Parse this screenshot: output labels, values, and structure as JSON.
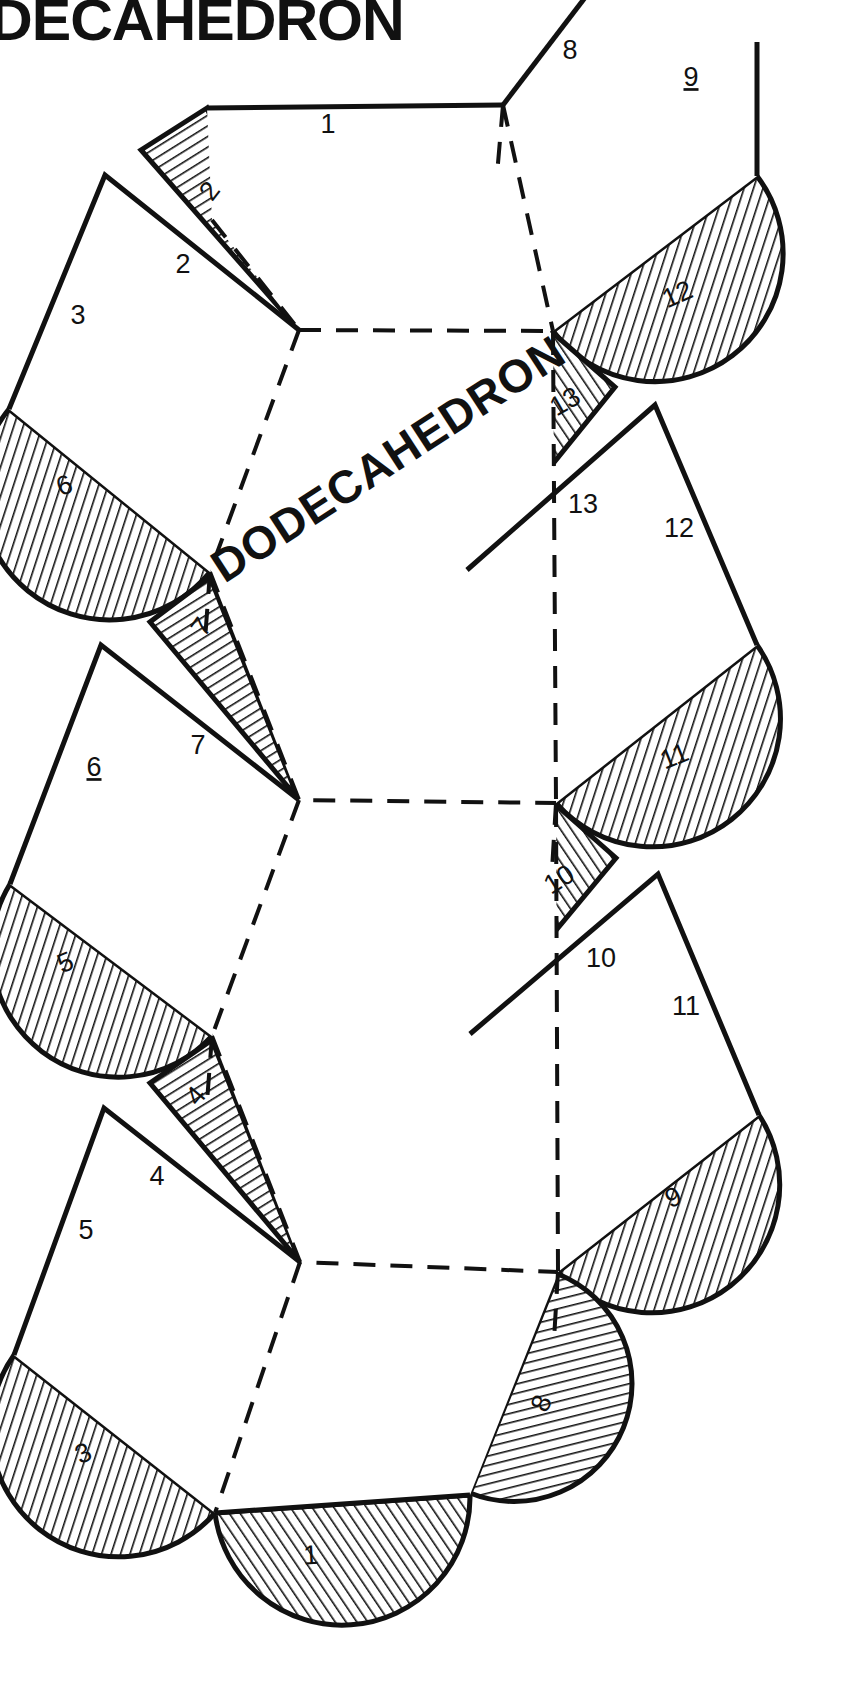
{
  "document": {
    "title": "DECAHEDRON",
    "center_caption": "DODECAHEDRON",
    "ink_color": "#111111",
    "paper_color": "#ffffff"
  },
  "net": {
    "type": "dodecahedron-net",
    "face_count": 6,
    "edge_style_solid": "cut",
    "edge_style_dashed": "fold",
    "tab_hatch": "diagonal-line-hatch"
  },
  "edge_labels": [
    {
      "id": "e1",
      "text": "1",
      "x": 328,
      "y": 126,
      "underline": false
    },
    {
      "id": "e8",
      "text": "8",
      "x": 570,
      "y": 52,
      "underline": false
    },
    {
      "id": "e9",
      "text": "9",
      "x": 691,
      "y": 79,
      "underline": true
    },
    {
      "id": "e2",
      "text": "2",
      "x": 183,
      "y": 266,
      "underline": false
    },
    {
      "id": "e3",
      "text": "3",
      "x": 78,
      "y": 317,
      "underline": false
    },
    {
      "id": "e13",
      "text": "13",
      "x": 583,
      "y": 506,
      "underline": false
    },
    {
      "id": "e12",
      "text": "12",
      "x": 679,
      "y": 530,
      "underline": false
    },
    {
      "id": "e7",
      "text": "7",
      "x": 198,
      "y": 747,
      "underline": false
    },
    {
      "id": "e6",
      "text": "6",
      "x": 94,
      "y": 769,
      "underline": true
    },
    {
      "id": "e10",
      "text": "10",
      "x": 601,
      "y": 960,
      "underline": false
    },
    {
      "id": "e11",
      "text": "11",
      "x": 686,
      "y": 1008,
      "underline": false
    },
    {
      "id": "e4",
      "text": "4",
      "x": 157,
      "y": 1178,
      "underline": false
    },
    {
      "id": "e5",
      "text": "5",
      "x": 86,
      "y": 1232,
      "underline": false
    }
  ],
  "tabs": [
    {
      "id": "t2",
      "text": "2",
      "shape": "triangle",
      "x": 211,
      "y": 192,
      "rotate": -52
    },
    {
      "id": "t12",
      "text": "12",
      "shape": "semicircle",
      "x": 678,
      "y": 296,
      "rotate": -24
    },
    {
      "id": "t13",
      "text": "13",
      "shape": "triangle",
      "x": 566,
      "y": 403,
      "rotate": -30
    },
    {
      "id": "t6",
      "text": "6",
      "shape": "semicircle",
      "x": 65,
      "y": 487,
      "rotate": -22
    },
    {
      "id": "t7",
      "text": "7",
      "shape": "triangle",
      "x": 203,
      "y": 628,
      "rotate": -54
    },
    {
      "id": "t11",
      "text": "11",
      "shape": "semicircle",
      "x": 675,
      "y": 758,
      "rotate": -22
    },
    {
      "id": "t10",
      "text": "10",
      "shape": "triangle",
      "x": 560,
      "y": 881,
      "rotate": -32
    },
    {
      "id": "t5",
      "text": "5",
      "shape": "semicircle",
      "x": 66,
      "y": 964,
      "rotate": -22
    },
    {
      "id": "t4",
      "text": "4",
      "shape": "triangle",
      "x": 197,
      "y": 1097,
      "rotate": -50
    },
    {
      "id": "t9",
      "text": "9",
      "shape": "semicircle",
      "x": 674,
      "y": 1199,
      "rotate": -24
    },
    {
      "id": "t8",
      "text": "8",
      "shape": "semicircle",
      "x": 543,
      "y": 1404,
      "rotate": -66
    },
    {
      "id": "t3",
      "text": "3",
      "shape": "semicircle",
      "x": 84,
      "y": 1455,
      "rotate": -24
    },
    {
      "id": "t1",
      "text": "1",
      "shape": "semicircle",
      "x": 311,
      "y": 1557,
      "rotate": -3
    }
  ]
}
